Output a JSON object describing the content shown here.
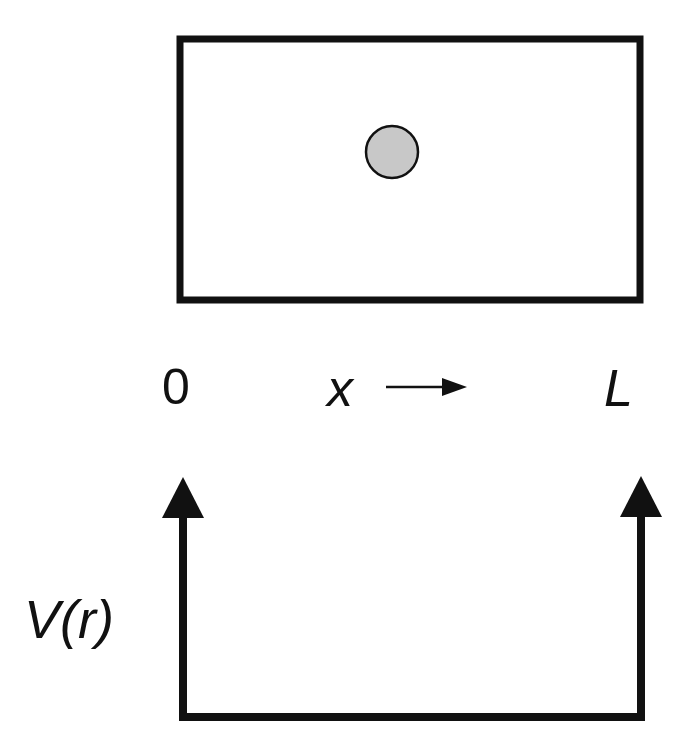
{
  "box": {
    "stroke": "#111111",
    "fill": "#ffffff"
  },
  "particle": {
    "fill": "#c8c8c8",
    "stroke": "#111111"
  },
  "axis": {
    "start_label": "0",
    "variable_label": "x",
    "end_label": "L"
  },
  "potential": {
    "label": "V(r)"
  }
}
